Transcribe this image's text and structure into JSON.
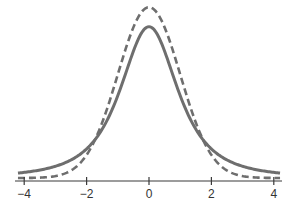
{
  "chart_data": {
    "type": "line",
    "title": "",
    "xlabel": "",
    "ylabel": "",
    "xlim": [
      -4.2,
      4.2
    ],
    "ylim": [
      0,
      0.4
    ],
    "grid": false,
    "legend": null,
    "x_ticks": [
      -4,
      -2,
      0,
      2,
      4
    ],
    "x_tick_labels": [
      "−4",
      "−2",
      "0",
      "2",
      "4"
    ],
    "x": [
      -4.2,
      -4,
      -3.5,
      -3,
      -2.5,
      -2,
      -1.5,
      -1,
      -0.5,
      0,
      0.5,
      1,
      1.5,
      2,
      2.5,
      3,
      3.5,
      4,
      4.2
    ],
    "series": [
      {
        "name": "heavy-tailed (t, df≈2)",
        "style": "solid",
        "color": "#6e6e6e",
        "values": [
          0.0115,
          0.0131,
          0.0189,
          0.0275,
          0.0422,
          0.068,
          0.114,
          0.1925,
          0.2962,
          0.3536,
          0.2962,
          0.1925,
          0.114,
          0.068,
          0.0422,
          0.0275,
          0.0189,
          0.0131,
          0.0115
        ]
      },
      {
        "name": "standard normal",
        "style": "dashed",
        "color": "#6e6e6e",
        "values": [
          0.0001,
          0.0001,
          0.0009,
          0.0044,
          0.0175,
          0.054,
          0.1295,
          0.242,
          0.3521,
          0.3989,
          0.3521,
          0.242,
          0.1295,
          0.054,
          0.0175,
          0.0044,
          0.0009,
          0.0001,
          0.0001
        ]
      }
    ]
  },
  "layout": {
    "axis_y_px": 181,
    "baseline_px": 178,
    "origin_x_px": 149,
    "px_per_unit_x": 31.2,
    "px_per_unit_y": 428,
    "axis_start_px": 15,
    "axis_end_px": 282
  }
}
